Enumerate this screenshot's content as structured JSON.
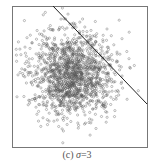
{
  "chart_data": {
    "type": "scatter",
    "title": "",
    "caption": "(c) σ=3",
    "caption_prefix": "(c) ",
    "caption_symbol": "σ",
    "caption_value": "=3",
    "xlabel": "",
    "ylabel": "",
    "grid": false,
    "legend": null,
    "series": [
      {
        "name": "samples",
        "distribution": "isotropic gaussian",
        "sigma": 3,
        "approx_count": 1500,
        "center_px": [
          72,
          74
        ],
        "spread_px": 21,
        "marker": "open-circle",
        "color": "#555555"
      }
    ],
    "decision_line": {
      "from_px": [
        53,
        6
      ],
      "to_px": [
        147,
        104
      ],
      "color": "#222222"
    },
    "frame_px": {
      "left": 12,
      "top": 6,
      "right": 147,
      "bottom": 147
    }
  }
}
